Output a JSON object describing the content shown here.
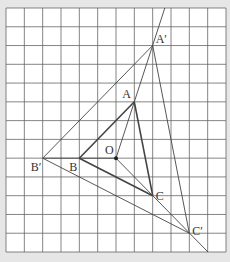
{
  "figure": {
    "background": "#e6e6e6",
    "paper": "#ffffff",
    "grid_color": "#666666",
    "line_color": "#444444",
    "grid": {
      "cols": 12,
      "rows": 13,
      "x0": 6,
      "y0": 8,
      "x1": 226,
      "y1": 252
    }
  },
  "points": {
    "O": {
      "label": "O",
      "x": 116,
      "y": 158.2,
      "label_dx": -11,
      "label_dy": -14
    },
    "A": {
      "label": "A",
      "x": 134.3,
      "y": 101.8,
      "label_dx": -12,
      "label_dy": -14
    },
    "B": {
      "label": "B",
      "x": 79.3,
      "y": 158.2,
      "label_dx": -10,
      "label_dy": 3
    },
    "C": {
      "label": "C",
      "x": 152.7,
      "y": 195.7,
      "label_dx": 3,
      "label_dy": -6
    },
    "A2": {
      "label": "A′",
      "x": 152.7,
      "y": 45.5,
      "label_dx": 3,
      "label_dy": -13
    },
    "B2": {
      "label": "B′",
      "x": 42.7,
      "y": 158.2,
      "label_dx": -12,
      "label_dy": 3
    },
    "C2": {
      "label": "C′",
      "x": 189.3,
      "y": 233.2,
      "label_dx": 3,
      "label_dy": -8
    }
  },
  "segments": [
    {
      "from": "A",
      "to": "B",
      "weight": "thick"
    },
    {
      "from": "B",
      "to": "C",
      "weight": "thick"
    },
    {
      "from": "C",
      "to": "A",
      "weight": "thick"
    },
    {
      "from": "A2",
      "to": "B2",
      "weight": "thin"
    },
    {
      "from": "B2",
      "to": "C2",
      "weight": "thin"
    },
    {
      "from": "C2",
      "to": "A2",
      "weight": "thin"
    }
  ],
  "rays": [
    {
      "from": "O",
      "through": "A2",
      "end": [
        164.8,
        8
      ]
    },
    {
      "from": "O",
      "through": "C2",
      "end": [
        208,
        252
      ]
    },
    {
      "from": "O",
      "through": "B2",
      "end": [
        42.7,
        158.2
      ]
    }
  ],
  "scale_factor": 2
}
